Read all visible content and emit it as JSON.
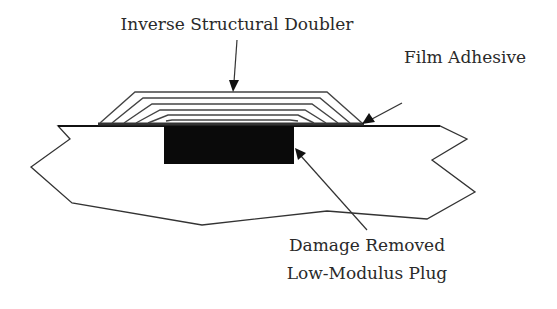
{
  "diagram": {
    "type": "cross-section repair schematic",
    "labels": {
      "doubler": "Inverse Structural Doubler",
      "adhesive": "Film Adhesive",
      "plug_line1": "Damage Removed",
      "plug_line2": "Low-Modulus Plug"
    },
    "components": [
      {
        "id": "inverse-structural-doubler",
        "description": "stepped stack of 6 composite plies bonded over the surface"
      },
      {
        "id": "film-adhesive",
        "description": "thin adhesive layer between doubler and skin"
      },
      {
        "id": "low-modulus-plug",
        "description": "black filled rectangle where damage was removed"
      },
      {
        "id": "parent-structure",
        "description": "broken-edge panel section"
      }
    ],
    "ply_count": 6,
    "colors": {
      "line": "#333333",
      "plug": "#0a0a0a",
      "background": "#ffffff"
    }
  }
}
